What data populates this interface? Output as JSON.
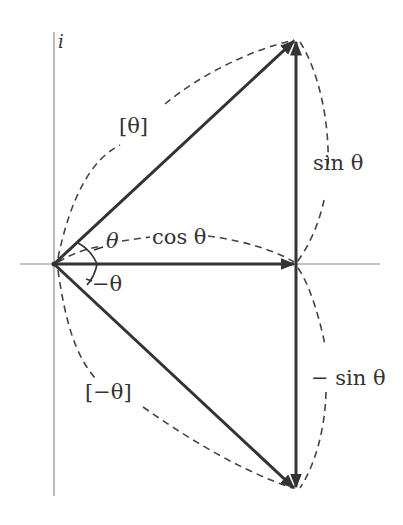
{
  "diagram": {
    "axis_label_imaginary": "i",
    "labels": {
      "rotation_pos": "[θ]",
      "rotation_neg": "[−θ]",
      "angle_pos": "θ",
      "angle_neg": "−θ",
      "cos": "cos θ",
      "sin_pos": "sin θ",
      "sin_neg": "− sin θ"
    },
    "vectors": [
      {
        "name": "rotation-theta",
        "from": "origin",
        "to": "cos θ + i sin θ"
      },
      {
        "name": "cos-theta",
        "from": "origin",
        "to": "cos θ"
      },
      {
        "name": "sin-theta",
        "from": "cos θ",
        "to": "cos θ + i sin θ"
      },
      {
        "name": "rotation-neg-theta",
        "from": "origin",
        "to": "cos θ − i sin θ"
      },
      {
        "name": "neg-sin-theta",
        "from": "cos θ",
        "to": "cos θ − i sin θ"
      }
    ],
    "colors": {
      "vector": "#333333",
      "axis": "#8a8a8a",
      "dashed": "#444444"
    }
  }
}
